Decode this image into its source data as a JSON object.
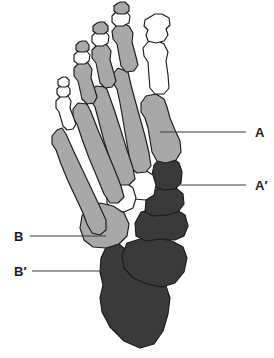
{
  "figure": {
    "view": "dorsal",
    "side": "left",
    "background_color": "#ffffff",
    "outline_color": "#1a1a1a"
  },
  "palette": {
    "white_bone": "#ffffff",
    "light_gray_bone": "#a8a8a8",
    "mid_gray_bone": "#9d9d9d",
    "dark_gray_bone": "#3a3a3a",
    "leader_line": "#3b3b3b",
    "label_text": "#1c1c1c"
  },
  "labels": [
    {
      "id": "label-a",
      "text": "A",
      "side": "right",
      "text_x": 255,
      "text_y": 137,
      "leader": {
        "x1": 160,
        "y1": 132,
        "x2": 246,
        "y2": 132
      },
      "points_to": "first-metatarsal"
    },
    {
      "id": "label-a-prime",
      "text": "A′",
      "side": "right",
      "text_x": 255,
      "text_y": 190,
      "leader": {
        "x1": 170,
        "y1": 185,
        "x2": 246,
        "y2": 185
      },
      "points_to": "medial-cuneiform"
    },
    {
      "id": "label-b",
      "text": "B",
      "side": "left",
      "text_x": 14,
      "text_y": 241,
      "leader": {
        "x1": 30,
        "y1": 236,
        "x2": 106,
        "y2": 236
      },
      "points_to": "cuboid"
    },
    {
      "id": "label-b-prime",
      "text": "B′",
      "side": "left",
      "text_x": 14,
      "text_y": 276,
      "leader": {
        "x1": 32,
        "y1": 271,
        "x2": 112,
        "y2": 271
      },
      "points_to": "calcaneus"
    }
  ],
  "bone_groups": [
    {
      "name": "distal-phalanges",
      "shade": "white",
      "count": 5
    },
    {
      "name": "middle-phalanges",
      "shade": "light-gray",
      "count": 4
    },
    {
      "name": "proximal-phalanges",
      "shade": "light-gray",
      "count": 5
    },
    {
      "name": "hallux-phalanges",
      "shade": "white",
      "count": 2
    },
    {
      "name": "metatarsals",
      "shade": "light-gray",
      "count": 5
    },
    {
      "name": "cuneiforms",
      "shade": "white",
      "count": 2
    },
    {
      "name": "medial-cuneiform",
      "shade": "dark-gray",
      "count": 1
    },
    {
      "name": "cuboid",
      "shade": "light-gray",
      "count": 1
    },
    {
      "name": "navicular",
      "shade": "dark-gray",
      "count": 1
    },
    {
      "name": "talus",
      "shade": "dark-gray",
      "count": 1
    },
    {
      "name": "calcaneus",
      "shade": "dark-gray",
      "count": 1
    }
  ]
}
